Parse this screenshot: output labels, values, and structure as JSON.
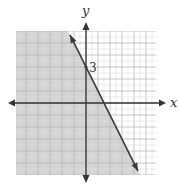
{
  "chart_data": {
    "type": "line",
    "title": "",
    "xlabel": "x",
    "ylabel": "y",
    "xlim": [
      -6,
      6
    ],
    "ylim": [
      -6,
      6
    ],
    "grid": true,
    "grid_step": 0.5,
    "legend": null,
    "annotations": [
      {
        "text": "3",
        "x": 0,
        "y": 3,
        "note": "y-intercept label"
      }
    ],
    "series": [
      {
        "name": "boundary line",
        "equation": "y = -2x + 3",
        "style": "solid",
        "x": [
          -1.33,
          4.33
        ],
        "y": [
          5.67,
          -5.67
        ],
        "arrows": "both ends"
      }
    ],
    "shaded_region": {
      "inequality": "y <= -2x + 3",
      "side": "left/below line"
    }
  },
  "labels": {
    "x_axis": "x",
    "y_axis": "y",
    "intercept": "3"
  },
  "colors": {
    "shade": "#d4d4d4",
    "grid_major": "#b8b8b8",
    "grid_minor": "#dedede",
    "axis": "#333333",
    "line": "#3a3a3a"
  }
}
